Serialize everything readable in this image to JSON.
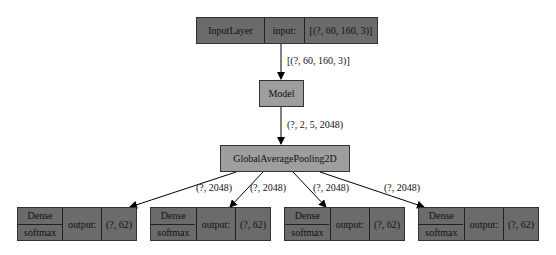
{
  "diagram": {
    "input_node": {
      "type": "InputLayer",
      "port": "input:",
      "shape": "[(?, 60, 160, 3)]",
      "color": "#6b6b6b"
    },
    "edge_input_model": "[(?, 60, 160, 3)]",
    "model_node": {
      "label": "Model",
      "color": "#9e9e9e"
    },
    "edge_model_gap": "(?, 2, 5, 2048)",
    "gap_node": {
      "label": "GlobalAveragePooling2D",
      "color": "#9e9e9e"
    },
    "output_edges": [
      "(?, 2048)",
      "(?, 2048)",
      "(?, 2048)",
      "(?, 2048)"
    ],
    "dense_nodes": [
      {
        "type": "Dense",
        "activation": "softmax",
        "port": "output:",
        "shape": "(?, 62)"
      },
      {
        "type": "Dense",
        "activation": "softmax",
        "port": "output:",
        "shape": "(?, 62)"
      },
      {
        "type": "Dense",
        "activation": "softmax",
        "port": "output:",
        "shape": "(?, 62)"
      },
      {
        "type": "Dense",
        "activation": "softmax",
        "port": "output:",
        "shape": "(?, 62)"
      }
    ]
  }
}
